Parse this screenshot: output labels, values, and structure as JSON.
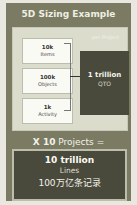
{
  "title": "5D Sizing Example",
  "panel": {
    "label": "per Project",
    "inputs": [
      {
        "value": "10k",
        "label": "Items"
      },
      {
        "value": "100k",
        "label": "Objects"
      },
      {
        "value": "1k",
        "label": "Activity"
      }
    ],
    "result": {
      "value": "1 trillion",
      "label": "QTO"
    }
  },
  "multiplier": {
    "factor": "X 10",
    "text": "Projects ="
  },
  "total": {
    "value": "10 trillion",
    "label": "Lines",
    "label_cn": "100万亿条记录"
  },
  "colors": {
    "card": "#7a7b62",
    "panel": "#dcdccd",
    "dark": "#4a4a3c"
  }
}
